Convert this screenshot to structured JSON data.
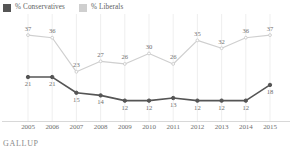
{
  "legend": {
    "items": [
      {
        "label": "% Conservatives",
        "color": "#555555",
        "icon": "legend-swatch-conservatives"
      },
      {
        "label": "% Liberals",
        "color": "#cfcfcf",
        "icon": "legend-swatch-liberals"
      }
    ]
  },
  "footer": {
    "brand": "GALLUP"
  },
  "chart_data": {
    "type": "line",
    "title": "",
    "xlabel": "",
    "ylabel": "",
    "ylim": [
      5,
      42
    ],
    "grid": true,
    "grid_axis": "x",
    "legend_position": "top-left",
    "categories": [
      "2005",
      "2006",
      "2007",
      "2008",
      "2009",
      "2010",
      "2011",
      "2012",
      "2013",
      "2014",
      "2015"
    ],
    "series": [
      {
        "name": "% Conservatives",
        "color": "#555555",
        "marker": "circle",
        "label_position": "below",
        "values": [
          21,
          21,
          15,
          14,
          12,
          12,
          13,
          12,
          12,
          12,
          18
        ]
      },
      {
        "name": "% Liberals",
        "color": "#cfcfcf",
        "marker": "circle",
        "label_position": "above",
        "values": [
          37,
          36,
          23,
          27,
          26,
          30,
          26,
          35,
          32,
          36,
          37
        ]
      }
    ]
  }
}
